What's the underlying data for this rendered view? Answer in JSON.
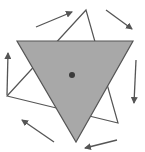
{
  "diagram": {
    "colors": {
      "background": "#ffffff",
      "fill": "#a8a8a8",
      "stroke": "#555555",
      "dot": "#3a3a3a",
      "outline_fill": "#ffffff"
    },
    "gray_triangle": {
      "points": "17,41 133,41 76,142"
    },
    "outline_triangle": {
      "points": "86,10 7,96 118,123"
    },
    "center_dot": {
      "cx": 72,
      "cy": 75,
      "r": 3
    },
    "arrows": [
      {
        "x1": 36,
        "y1": 27,
        "x2": 72,
        "y2": 12
      },
      {
        "x1": 106,
        "y1": 10,
        "x2": 132,
        "y2": 29
      },
      {
        "x1": 136,
        "y1": 60,
        "x2": 134,
        "y2": 103
      },
      {
        "x1": 117,
        "y1": 140,
        "x2": 85,
        "y2": 148
      },
      {
        "x1": 54,
        "y1": 142,
        "x2": 22,
        "y2": 120
      },
      {
        "x1": 7,
        "y1": 95,
        "x2": 8,
        "y2": 53
      }
    ]
  }
}
